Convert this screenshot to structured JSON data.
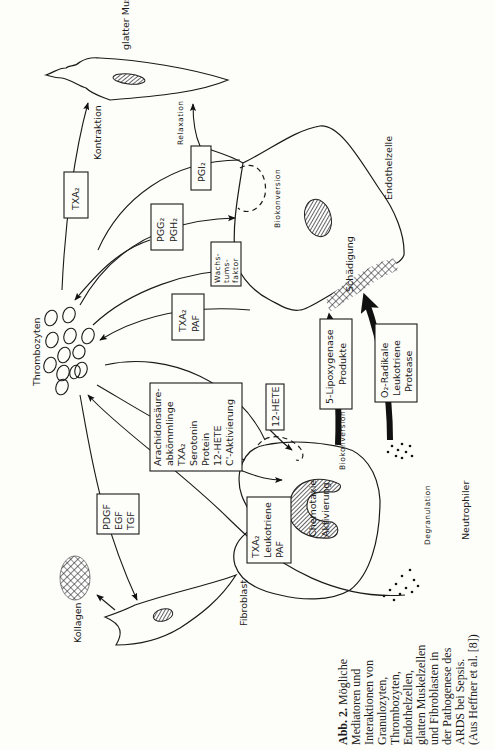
{
  "figure": {
    "cells": {
      "smooth_muscle": "glatter Muskel",
      "endothelial": "Endothelzelle",
      "platelets": "Thrombozyten",
      "neutrophil": "Neutrophiler",
      "fibroblast": "Fibroblast",
      "collagen": "Kollagen"
    },
    "process_labels": {
      "contraction": "Kontraktion",
      "relaxation": "Relaxation",
      "bioconversion_endo": "Biokonversion",
      "damage": "Schädigung",
      "bioconversion_neutro": "Biokonversion",
      "chemotaxis": "Chemotaxie",
      "activation": "Aktivierung",
      "degranulation": "Degranulation"
    },
    "boxes": {
      "txa2_top": [
        "TXA₂"
      ],
      "pgi2": [
        "PGI₂"
      ],
      "pgg2_pgh2": [
        "PGG₂",
        "PGH₂"
      ],
      "growth_factor": [
        "Wachs-",
        "tums-",
        "faktor"
      ],
      "txa2_paf": [
        "TXA₂",
        "PAF"
      ],
      "arachidonic": [
        "Arachidonsäure-",
        "abkömmlinge",
        "TXA₂",
        "Serotonin",
        "Protein",
        "12-HETE",
        "C'-Aktivierung"
      ],
      "hete12": [
        "12-HETE"
      ],
      "lipoxygenase": [
        "5-Lipoxygenase",
        "Produkte"
      ],
      "radicals": [
        "O₂-Radikale",
        "Leukotriene",
        "Protease"
      ],
      "pdgf": [
        "PDGF",
        "EGF",
        "TGF"
      ],
      "txa2_lt_paf": [
        "TXA₂",
        "Leukotriene",
        "PAF"
      ]
    },
    "caption": {
      "label": "Abb. 2.",
      "lines": [
        "Mögliche",
        "Mediatoren und",
        "Interaktionen von",
        "Granulozyten,",
        "Thrombozyten,",
        "Endothelzellen,",
        "glatten Muskelzellen",
        "und Fibroblasten in",
        "der Pathogenese des",
        "ARDS bei Sepsis.",
        "(Aus Heffner et al. [8])"
      ]
    }
  }
}
